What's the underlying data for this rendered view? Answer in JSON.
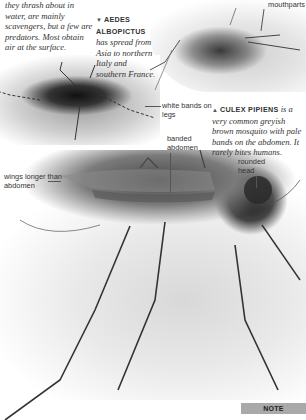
{
  "intro_text": "they thrash about in water, are mainly scavengers, but a few are predators. Most obtain air at the surface.",
  "captions": {
    "aedes": {
      "marker": "▼",
      "title": "AEDES ALBOPICTUS",
      "body": "has spread from Asia to northern Italy and southern France."
    },
    "culex": {
      "marker": "▲",
      "title": "CULEX PIPIENS",
      "body": "is a very common greyish brown mosquito with pale bands on the abdomen. It rarely bites humans."
    }
  },
  "labels": {
    "mouthparts": "mouthparts",
    "white_bands": "white bands on legs",
    "banded_abdomen": "banded abdomen",
    "wings": "wings longer than abdomen",
    "rounded_head": "rounded head"
  },
  "photos": {
    "top_right": "mosquito-photo-culex-feeding",
    "left": "mosquito-photo-aedes-albopictus",
    "main": "mosquito-photo-culex-pipiens"
  },
  "footer": {
    "note_label": "NOTE",
    "note_color": "#a9a9a9"
  }
}
